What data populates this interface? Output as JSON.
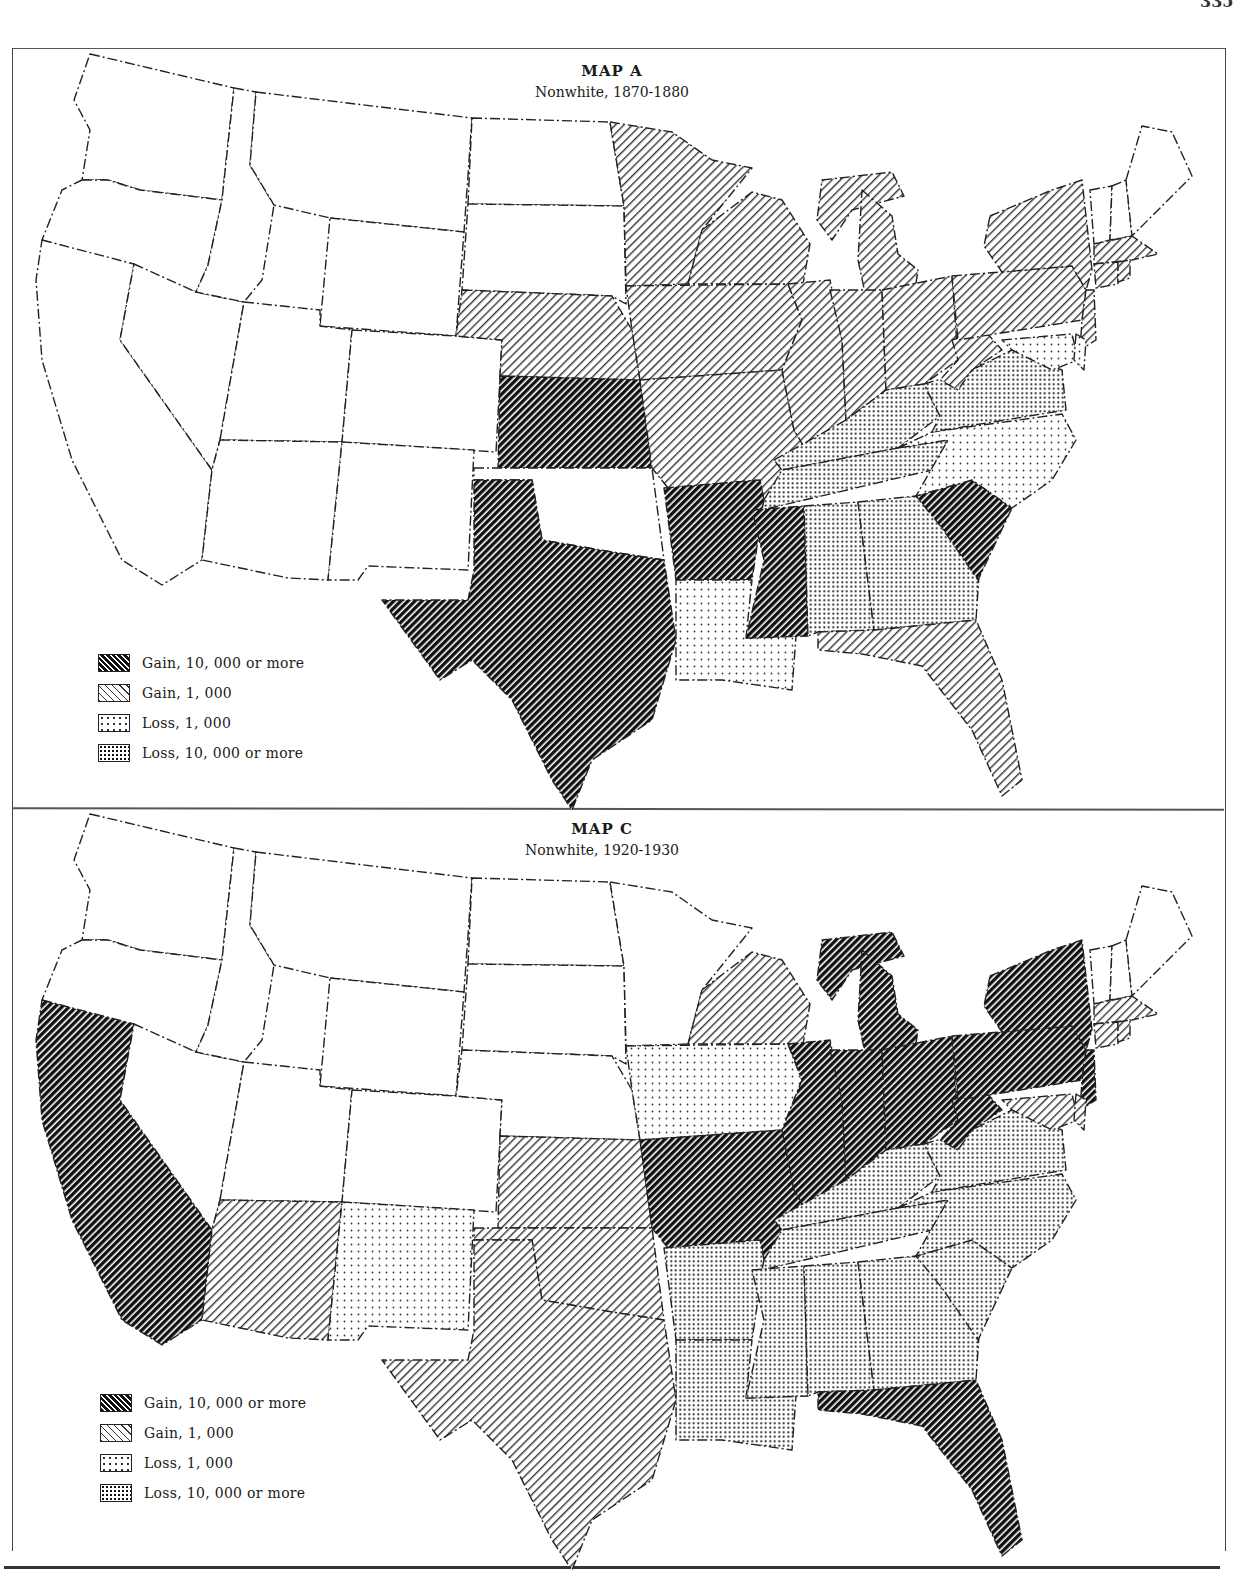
{
  "page": {
    "number": "335"
  },
  "categories": {
    "gain_hi": {
      "label": "Gain, 10, 000 or more",
      "pattern": "dense-diagonal-hatch",
      "fill": "#1a1a1a"
    },
    "gain_lo": {
      "label": "Gain, 1, 000",
      "pattern": "light-diagonal-hatch",
      "fill": "#7a7a7a"
    },
    "loss_lo": {
      "label": "Loss, 1, 000",
      "pattern": "sparse-dots",
      "fill": "#d8d8d8"
    },
    "loss_hi": {
      "label": "Loss, 10, 000 or more",
      "pattern": "dense-dots",
      "fill": "#b0b0b0"
    },
    "none": {
      "label": "",
      "pattern": "blank",
      "fill": "#ffffff"
    }
  },
  "maps": [
    {
      "id": "map-a",
      "title": "MAP A",
      "subtitle": "Nonwhite, 1870-1880",
      "legend": [
        "Gain, 10, 000 or more",
        "Gain, 1, 000",
        "Loss, 1, 000",
        "Loss, 10, 000 or more"
      ]
    },
    {
      "id": "map-c",
      "title": "MAP C",
      "subtitle": "Nonwhite, 1920-1930",
      "legend": [
        "Gain, 10, 000 or more",
        "Gain, 1, 000",
        "Loss, 1, 000",
        "Loss, 10, 000 or more"
      ]
    }
  ],
  "chart_data": [
    {
      "type": "choropleth",
      "title": "MAP A",
      "subtitle": "Nonwhite, 1870-1880",
      "legend_position": "lower-left",
      "legend": [
        "Gain, 10,000 or more",
        "Gain, 1,000",
        "Loss, 1,000",
        "Loss, 10,000 or more"
      ],
      "states": {
        "WA": "none",
        "OR": "none",
        "CA": "none",
        "NV": "none",
        "ID": "none",
        "MT": "none",
        "WY": "none",
        "UT": "none",
        "CO": "none",
        "AZ": "none",
        "NM": "none",
        "ND": "none",
        "SD": "none",
        "NE": "gain_lo",
        "KS": "gain_hi",
        "OK": "none",
        "TX": "gain_hi",
        "MN": "gain_lo",
        "IA": "gain_lo",
        "MO": "gain_lo",
        "AR": "gain_hi",
        "LA": "loss_lo",
        "WI": "gain_lo",
        "IL": "gain_lo",
        "MI": "gain_lo",
        "IN": "gain_lo",
        "OH": "gain_lo",
        "KY": "loss_hi",
        "TN": "loss_hi",
        "MS": "gain_hi",
        "AL": "loss_hi",
        "GA": "loss_hi",
        "FL": "gain_lo",
        "SC": "gain_hi",
        "NC": "loss_lo",
        "VA": "loss_hi",
        "WV": "gain_lo",
        "PA": "gain_lo",
        "NY": "gain_lo",
        "NJ": "gain_lo",
        "MD": "loss_lo",
        "DE": "loss_lo",
        "VT": "none",
        "NH": "none",
        "ME": "none",
        "MA": "gain_lo",
        "CT": "gain_lo",
        "RI": "gain_lo"
      }
    },
    {
      "type": "choropleth",
      "title": "MAP C",
      "subtitle": "Nonwhite, 1920-1930",
      "legend_position": "lower-left",
      "legend": [
        "Gain, 10,000 or more",
        "Gain, 1,000",
        "Loss, 1,000",
        "Loss, 10,000 or more"
      ],
      "states": {
        "WA": "none",
        "OR": "none",
        "CA": "gain_hi",
        "NV": "none",
        "ID": "none",
        "MT": "none",
        "WY": "none",
        "UT": "none",
        "CO": "none",
        "AZ": "gain_lo",
        "NM": "loss_lo",
        "ND": "none",
        "SD": "none",
        "NE": "none",
        "KS": "gain_lo",
        "OK": "gain_lo",
        "TX": "gain_lo",
        "MN": "none",
        "IA": "loss_lo",
        "MO": "gain_hi",
        "AR": "loss_hi",
        "LA": "loss_hi",
        "WI": "gain_lo",
        "IL": "gain_hi",
        "MI": "gain_hi",
        "IN": "gain_hi",
        "OH": "gain_hi",
        "KY": "loss_hi",
        "TN": "loss_hi",
        "MS": "loss_hi",
        "AL": "loss_hi",
        "GA": "loss_hi",
        "FL": "gain_hi",
        "SC": "loss_hi",
        "NC": "loss_hi",
        "VA": "loss_hi",
        "WV": "gain_hi",
        "PA": "gain_hi",
        "NY": "gain_hi",
        "NJ": "gain_hi",
        "MD": "gain_lo",
        "DE": "gain_lo",
        "VT": "none",
        "NH": "none",
        "ME": "none",
        "MA": "gain_lo",
        "CT": "gain_lo",
        "RI": "gain_lo"
      }
    }
  ]
}
